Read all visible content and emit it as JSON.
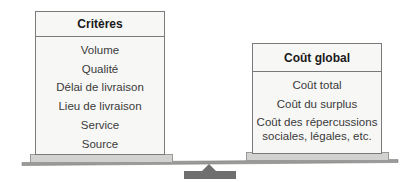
{
  "left_panel": {
    "title": "Critères",
    "items": [
      "Volume",
      "Qualité",
      "Délai de livraison",
      "Lieu de livraison",
      "Service",
      "Source"
    ]
  },
  "right_panel": {
    "title": "Coût global",
    "items": [
      "Coût total",
      "Coût du surplus",
      "Coût des répercussions sociales, légales, etc."
    ]
  },
  "colors": {
    "panel_fill": "#f7f7f6",
    "panel_border": "#7a7a7a",
    "plate_fill": "#d2d2d0",
    "beam": "#8c8c8a",
    "fulcrum": "#6f6f6f"
  }
}
